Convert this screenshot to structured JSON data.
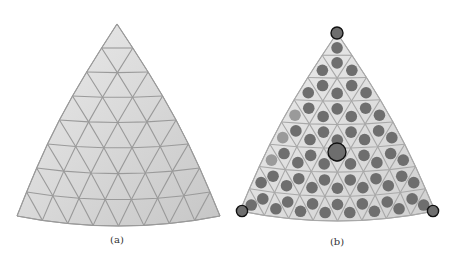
{
  "figure": {
    "panels": [
      {
        "id": "a",
        "caption": "(a)",
        "caption_pos": [
          117,
          234
        ],
        "apex": [
          117,
          24
        ],
        "left": [
          17,
          216
        ],
        "right": [
          220,
          216
        ],
        "base_sag": 10,
        "side_bulge": 14,
        "rows": 8,
        "fill_light": "#ececec",
        "fill_dark": "#c6c6c6",
        "line_color": "#9a9a9a",
        "show_circles": false
      },
      {
        "id": "b",
        "caption": "(b)",
        "caption_pos": [
          337,
          236
        ],
        "apex": [
          337,
          33
        ],
        "left": [
          240,
          211
        ],
        "right": [
          435,
          211
        ],
        "base_sag": 10,
        "side_bulge": 13,
        "rows": 8,
        "fill_light": "#ededed",
        "fill_dark": "#d0d0d0",
        "line_color": "#a8a8a8",
        "show_circles": true,
        "circle_color": "#6e6e6e",
        "light_circle_color": "#9a9a9a",
        "highlight_stroke": "#111111",
        "highlighted": [
          "apex",
          "center",
          "left",
          "right"
        ]
      }
    ]
  }
}
